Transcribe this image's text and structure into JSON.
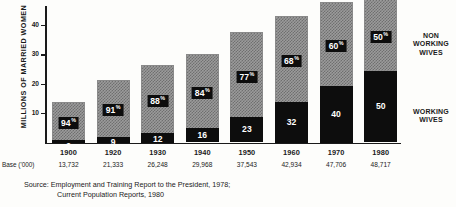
{
  "chart_data": {
    "type": "bar",
    "subtype": "stacked-bar",
    "title": "",
    "xlabel": "",
    "ylabel": "MILLIONS OF MARRIED WOMEN",
    "ylim": [
      0,
      55
    ],
    "yticks": [
      10,
      20,
      30,
      40,
      50
    ],
    "grid": false,
    "legend_position": "right",
    "categories": [
      "1900",
      "1920",
      "1930",
      "1940",
      "1950",
      "1960",
      "1970",
      "1980"
    ],
    "base_label": "Base ('000)",
    "base_values": [
      "13,732",
      "21,333",
      "26,248",
      "29,968",
      "37,543",
      "42,934",
      "47,706",
      "48,717"
    ],
    "totals": [
      13.732,
      21.333,
      26.248,
      29.968,
      37.543,
      42.934,
      47.706,
      48.717
    ],
    "series": [
      {
        "name": "WORKING WIVES",
        "color": "#0d0d0d",
        "unit": "percent",
        "values": [
          6,
          9,
          12,
          16,
          23,
          32,
          40,
          50
        ],
        "labels": [
          "6",
          "9",
          "12",
          "16",
          "23",
          "32",
          "40",
          "50"
        ]
      },
      {
        "name": "NON WORKING WIVES",
        "color": "#9b9b9b",
        "unit": "percent",
        "values": [
          94,
          91,
          88,
          84,
          77,
          68,
          60,
          50
        ],
        "labels": [
          "94",
          "91",
          "88",
          "84",
          "77",
          "68",
          "60",
          "50"
        ]
      }
    ],
    "legend": [
      {
        "line1": "NON",
        "line2": "WORKING",
        "line3": "WIVES"
      },
      {
        "line1": "WORKING",
        "line2": "WIVES",
        "line3": ""
      }
    ],
    "source": {
      "line1": "Source: Employment and Training Report to the President, 1978;",
      "line2": "Current Population Reports, 1980"
    }
  },
  "legend": {
    "nonworking": "NON WORKING WIVES",
    "working": "WORKING WIVES"
  }
}
